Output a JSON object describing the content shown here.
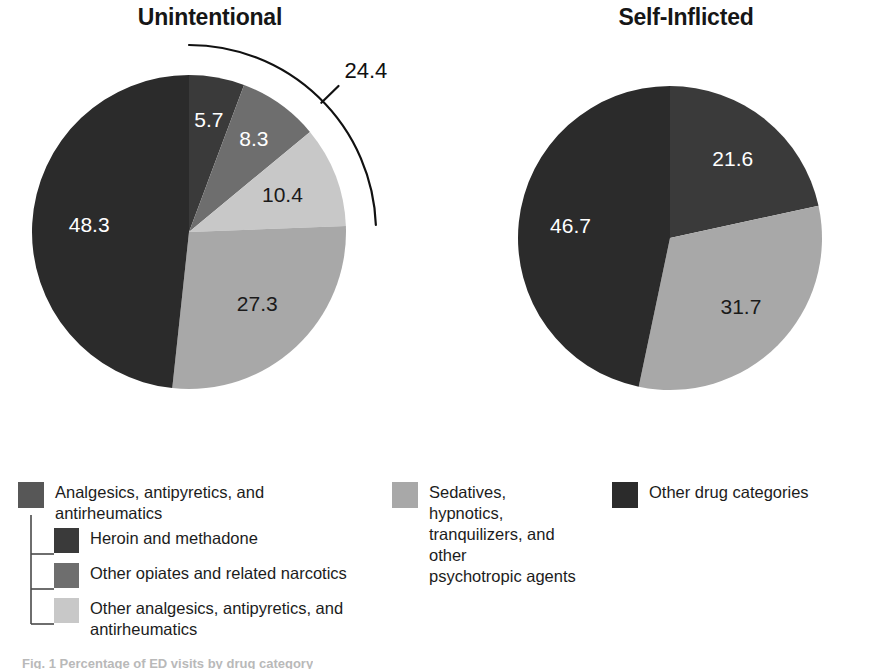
{
  "figure": {
    "caption_fragment": "Fig. 1  Percentage of ED visits by drug category"
  },
  "palette": {
    "analgesics_parent": "#575757",
    "heroin_methadone": "#3a3a3a",
    "other_opiates": "#6e6e6e",
    "other_analgesics": "#c8c8c8",
    "sedatives": "#a8a8a8",
    "other_drug_categories": "#2b2b2b",
    "label_on_dark": "#ffffff",
    "label_on_light": "#1a1a1a",
    "annotation_stroke": "#111111"
  },
  "legend": {
    "primary_group": {
      "parent_label": "Analgesics, antipyretics, and\nantirheumatics",
      "children": [
        {
          "label": "Heroin and methadone",
          "color_key": "heroin_methadone"
        },
        {
          "label": "Other opiates and related narcotics",
          "color_key": "other_opiates"
        },
        {
          "label": "Other analgesics, antipyretics, and antirheumatics",
          "color_key": "other_analgesics"
        }
      ]
    },
    "sedatives": {
      "label": "Sedatives, hypnotics,\ntranquilizers, and other\npsychotropic agents",
      "color_key": "sedatives"
    },
    "other": {
      "label": "Other drug categories",
      "color_key": "other_drug_categories"
    }
  },
  "chart_data": [
    {
      "type": "pie",
      "title": "Unintentional",
      "start_angle_deg": 0,
      "direction": "clockwise",
      "value_suffix": "",
      "categories": [
        "Heroin and methadone",
        "Other opiates and related narcotics",
        "Other analgesics, antipyretics, and antirheumatics",
        "Sedatives, hypnotics, tranquilizers, and other psychotropic agents",
        "Other drug categories"
      ],
      "values": [
        5.7,
        8.3,
        10.4,
        27.3,
        48.3
      ],
      "colors": [
        "#3a3a3a",
        "#6e6e6e",
        "#c8c8c8",
        "#a8a8a8",
        "#2b2b2b"
      ],
      "label_colors": [
        "#ffffff",
        "#ffffff",
        "#1a1a1a",
        "#1a1a1a",
        "#ffffff"
      ],
      "annotation": {
        "label": "24.4",
        "spans_categories": [
          "Heroin and methadone",
          "Other opiates and related narcotics",
          "Other analgesics, antipyretics, and antirheumatics"
        ],
        "span_value": 24.4,
        "style": "outer-arc-bracket"
      }
    },
    {
      "type": "pie",
      "title": "Self-Inflicted",
      "start_angle_deg": 0,
      "direction": "clockwise",
      "value_suffix": "",
      "categories": [
        "Analgesics, antipyretics, and antirheumatics",
        "Sedatives, hypnotics, tranquilizers, and other psychotropic agents",
        "Other drug categories"
      ],
      "values": [
        21.6,
        31.7,
        46.7
      ],
      "colors": [
        "#3a3a3a",
        "#a8a8a8",
        "#2b2b2b"
      ],
      "label_colors": [
        "#ffffff",
        "#1a1a1a",
        "#ffffff"
      ]
    }
  ]
}
